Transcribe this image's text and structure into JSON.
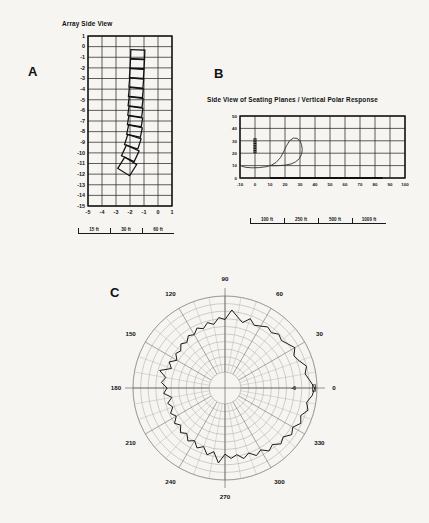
{
  "document": {
    "background_color": "#f6f5f2",
    "ink_color": "#141414"
  },
  "panels": {
    "a": {
      "letter": "A",
      "title": "Array Side View",
      "x_ticks": [
        "-5",
        "-4",
        "-3",
        "-2",
        "-1",
        "0",
        "1"
      ],
      "y_ticks": [
        "1",
        "0",
        "-1",
        "-2",
        "-3",
        "-4",
        "-5",
        "-6",
        "-7",
        "-8",
        "-9",
        "-10",
        "-11",
        "-12",
        "-13",
        "-14",
        "-15"
      ],
      "scale_labels": [
        "15 ft",
        "30 ft",
        "60 ft"
      ]
    },
    "b": {
      "letter": "B",
      "title": "Side View of Seating Planes / Vertical Polar Response",
      "x_ticks": [
        "-10",
        "0",
        "10",
        "20",
        "30",
        "40",
        "50",
        "60",
        "70",
        "80",
        "90",
        "100"
      ],
      "y_ticks": [
        "0",
        "10",
        "20",
        "30",
        "40",
        "50"
      ],
      "scale_labels": [
        "100 ft",
        "250 ft",
        "500 ft",
        "1000 ft"
      ]
    },
    "c": {
      "letter": "C",
      "angle_labels": [
        "0",
        "30",
        "60",
        "90",
        "120",
        "150",
        "180",
        "210",
        "240",
        "270",
        "300",
        "330"
      ],
      "db_label": "-6"
    }
  },
  "chart_data": [
    {
      "type": "line",
      "panel": "A",
      "title": "Array Side View",
      "xlabel": "",
      "ylabel": "",
      "xlim": [
        -5,
        1
      ],
      "ylim": [
        -15,
        1
      ],
      "grid": true,
      "description": "Side elevation of a curved line array of 12 loudspeaker cabinets",
      "cabinets": [
        {
          "y_top": -0.3,
          "y_bottom": -1.15,
          "x_center": -1.45,
          "tilt_deg": 2
        },
        {
          "y_top": -1.2,
          "y_bottom": -2.05,
          "x_center": -1.48,
          "tilt_deg": 3
        },
        {
          "y_top": -2.1,
          "y_bottom": -2.95,
          "x_center": -1.52,
          "tilt_deg": 4
        },
        {
          "y_top": -3.0,
          "y_bottom": -3.85,
          "x_center": -1.55,
          "tilt_deg": 5
        },
        {
          "y_top": -3.9,
          "y_bottom": -4.75,
          "x_center": -1.58,
          "tilt_deg": 6
        },
        {
          "y_top": -4.8,
          "y_bottom": -5.65,
          "x_center": -1.6,
          "tilt_deg": 7
        },
        {
          "y_top": -5.7,
          "y_bottom": -6.55,
          "x_center": -1.62,
          "tilt_deg": 8
        },
        {
          "y_top": -6.6,
          "y_bottom": -7.45,
          "x_center": -1.64,
          "tilt_deg": 9
        },
        {
          "y_top": -7.5,
          "y_bottom": -8.4,
          "x_center": -1.68,
          "tilt_deg": 12
        },
        {
          "y_top": -8.45,
          "y_bottom": -9.45,
          "x_center": -1.8,
          "tilt_deg": 18
        },
        {
          "y_top": -9.5,
          "y_bottom": -10.6,
          "x_center": -1.98,
          "tilt_deg": 25
        },
        {
          "y_top": -10.65,
          "y_bottom": -11.9,
          "x_center": -2.2,
          "tilt_deg": 32
        }
      ]
    },
    {
      "type": "line",
      "panel": "B",
      "title": "Side View of Seating Planes / Vertical Polar Response",
      "xlabel": "",
      "ylabel": "",
      "xlim": [
        -10,
        100
      ],
      "ylim": [
        0,
        50
      ],
      "grid": true,
      "description": "Seating plane profile with vertical polar response overlay",
      "array_marker": {
        "x": 0,
        "y_top": 32,
        "y_bottom": 20
      },
      "seating_floor": [
        {
          "x": 10,
          "y": 0
        },
        {
          "x": 85,
          "y": 0
        }
      ],
      "response_curve": [
        {
          "x": -9,
          "y": 9.5
        },
        {
          "x": -6,
          "y": 8.6
        },
        {
          "x": -2,
          "y": 8.2
        },
        {
          "x": 3,
          "y": 8.4
        },
        {
          "x": 8,
          "y": 9.2
        },
        {
          "x": 11,
          "y": 10.4
        },
        {
          "x": 14,
          "y": 12.5
        },
        {
          "x": 17,
          "y": 16.5
        },
        {
          "x": 19,
          "y": 21.0
        },
        {
          "x": 21,
          "y": 26.0
        },
        {
          "x": 23,
          "y": 30.0
        },
        {
          "x": 25.5,
          "y": 32.2
        },
        {
          "x": 28,
          "y": 32.0
        },
        {
          "x": 30,
          "y": 30.0
        },
        {
          "x": 31,
          "y": 27.0
        },
        {
          "x": 31.5,
          "y": 23.0
        },
        {
          "x": 31,
          "y": 19.0
        },
        {
          "x": 29.5,
          "y": 15.5
        },
        {
          "x": 27,
          "y": 13.0
        },
        {
          "x": 24,
          "y": 11.3
        },
        {
          "x": 20,
          "y": 10.4
        },
        {
          "x": 16,
          "y": 10.0
        },
        {
          "x": 12,
          "y": 9.9
        },
        {
          "x": 10,
          "y": 10.0
        }
      ]
    },
    {
      "type": "line",
      "panel": "C",
      "title": "",
      "plot_kind": "polar",
      "grid": true,
      "angle_labels": [
        0,
        30,
        60,
        90,
        120,
        150,
        180,
        210,
        240,
        270,
        300,
        330
      ],
      "radial_rings": 10,
      "angular_spokes": 36,
      "db_ring_label": "-6",
      "description": "Horizontal polar response plot, normalized, with ragged measured contour",
      "polar_values": [
        {
          "angle": 0,
          "r": 0.97
        },
        {
          "angle": 5,
          "r": 0.91
        },
        {
          "angle": 10,
          "r": 0.86
        },
        {
          "angle": 15,
          "r": 0.9
        },
        {
          "angle": 20,
          "r": 0.83
        },
        {
          "angle": 25,
          "r": 0.79
        },
        {
          "angle": 30,
          "r": 0.85
        },
        {
          "angle": 35,
          "r": 0.8
        },
        {
          "angle": 40,
          "r": 0.76
        },
        {
          "angle": 45,
          "r": 0.79
        },
        {
          "angle": 50,
          "r": 0.74
        },
        {
          "angle": 55,
          "r": 0.77
        },
        {
          "angle": 60,
          "r": 0.73
        },
        {
          "angle": 65,
          "r": 0.7
        },
        {
          "angle": 70,
          "r": 0.76
        },
        {
          "angle": 75,
          "r": 0.68
        },
        {
          "angle": 80,
          "r": 0.74
        },
        {
          "angle": 85,
          "r": 0.82
        },
        {
          "angle": 90,
          "r": 0.69
        },
        {
          "angle": 95,
          "r": 0.72
        },
        {
          "angle": 100,
          "r": 0.64
        },
        {
          "angle": 105,
          "r": 0.68
        },
        {
          "angle": 110,
          "r": 0.62
        },
        {
          "angle": 115,
          "r": 0.66
        },
        {
          "angle": 120,
          "r": 0.6
        },
        {
          "angle": 125,
          "r": 0.63
        },
        {
          "angle": 130,
          "r": 0.57
        },
        {
          "angle": 135,
          "r": 0.61
        },
        {
          "angle": 140,
          "r": 0.55
        },
        {
          "angle": 145,
          "r": 0.58
        },
        {
          "angle": 150,
          "r": 0.52
        },
        {
          "angle": 155,
          "r": 0.6
        },
        {
          "angle": 160,
          "r": 0.54
        },
        {
          "angle": 165,
          "r": 0.68
        },
        {
          "angle": 170,
          "r": 0.58
        },
        {
          "angle": 175,
          "r": 0.63
        },
        {
          "angle": 180,
          "r": 0.55
        },
        {
          "angle": 185,
          "r": 0.6
        },
        {
          "angle": 190,
          "r": 0.5
        },
        {
          "angle": 195,
          "r": 0.57
        },
        {
          "angle": 200,
          "r": 0.52
        },
        {
          "angle": 205,
          "r": 0.58
        },
        {
          "angle": 210,
          "r": 0.53
        },
        {
          "angle": 215,
          "r": 0.6
        },
        {
          "angle": 220,
          "r": 0.55
        },
        {
          "angle": 225,
          "r": 0.62
        },
        {
          "angle": 230,
          "r": 0.57
        },
        {
          "angle": 235,
          "r": 0.64
        },
        {
          "angle": 240,
          "r": 0.59
        },
        {
          "angle": 245,
          "r": 0.66
        },
        {
          "angle": 250,
          "r": 0.61
        },
        {
          "angle": 255,
          "r": 0.7
        },
        {
          "angle": 260,
          "r": 0.64
        },
        {
          "angle": 265,
          "r": 0.78
        },
        {
          "angle": 270,
          "r": 0.66
        },
        {
          "angle": 275,
          "r": 0.72
        },
        {
          "angle": 280,
          "r": 0.68
        },
        {
          "angle": 285,
          "r": 0.75
        },
        {
          "angle": 290,
          "r": 0.7
        },
        {
          "angle": 295,
          "r": 0.77
        },
        {
          "angle": 300,
          "r": 0.73
        },
        {
          "angle": 305,
          "r": 0.8
        },
        {
          "angle": 310,
          "r": 0.76
        },
        {
          "angle": 315,
          "r": 0.83
        },
        {
          "angle": 320,
          "r": 0.79
        },
        {
          "angle": 325,
          "r": 0.86
        },
        {
          "angle": 330,
          "r": 0.82
        },
        {
          "angle": 335,
          "r": 0.89
        },
        {
          "angle": 340,
          "r": 0.85
        },
        {
          "angle": 345,
          "r": 0.92
        },
        {
          "angle": 350,
          "r": 0.88
        },
        {
          "angle": 355,
          "r": 0.94
        }
      ]
    }
  ]
}
